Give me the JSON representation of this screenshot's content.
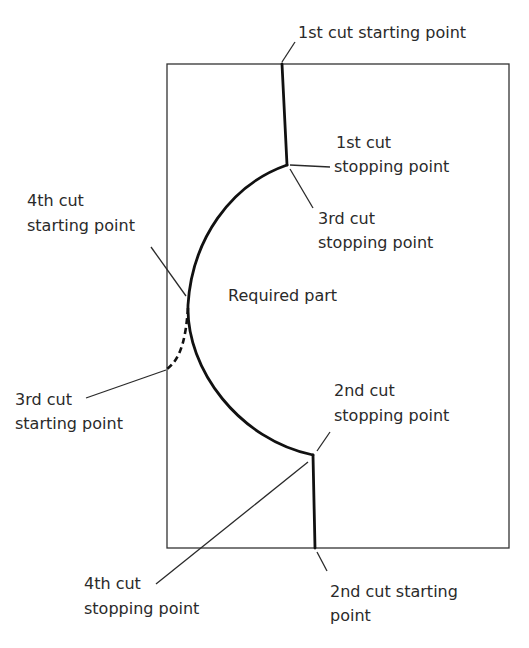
{
  "diagram": {
    "colors": {
      "line": "#111111",
      "text": "#2a2a2a",
      "background": "#ffffff"
    },
    "center_label": "Required part",
    "labels": {
      "cut1_start": "1st cut starting point",
      "cut1_stop_l1": "1st cut",
      "cut1_stop_l2": "stopping point",
      "cut3_stop_l1": "3rd cut",
      "cut3_stop_l2": "stopping point",
      "cut4_start_l1": "4th cut",
      "cut4_start_l2": "starting point",
      "cut3_start_l1": "3rd cut",
      "cut3_start_l2": "starting point",
      "cut2_stop_l1": "2nd cut",
      "cut2_stop_l2": "stopping point",
      "cut4_stop_l1": "4th cut",
      "cut4_stop_l2": "stopping point",
      "cut2_start_l1": "2nd cut starting",
      "cut2_start_l2": "point"
    }
  }
}
